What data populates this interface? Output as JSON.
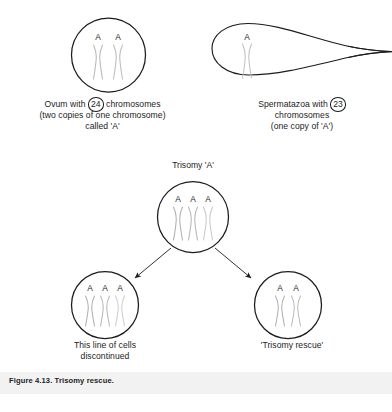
{
  "figure": {
    "caption": "Figure 4.13. Trisomy rescue.",
    "caption_band_color": "#f2f2f2",
    "background_color": "#ffffff",
    "stroke_color": "#1c1c1c",
    "chromosome_color": "#b8b8b8"
  },
  "gametes": {
    "ovum": {
      "cell_label": "ovum-circle",
      "chromosome_letters": [
        "A",
        "A"
      ],
      "chromosome_count": 2,
      "caption_lines": [
        "Ovum with ",
        " chromosomes",
        "(two copies of one chromosome)",
        "called 'A'"
      ],
      "circled_number": "24"
    },
    "sperm": {
      "cell_label": "spermatazoa-shape",
      "chromosome_letters": [
        "A"
      ],
      "chromosome_count": 1,
      "caption_lines": [
        "Spermatazoa with ",
        "chromosomes",
        "(one copy of 'A')"
      ],
      "circled_number": "23"
    }
  },
  "trisomy": {
    "top_label": "Trisomy 'A'",
    "parent": {
      "chromosome_letters": [
        "A",
        "A",
        "A"
      ],
      "chromosome_count": 3
    },
    "children": [
      {
        "position": "left",
        "chromosome_letters": [
          "A",
          "A",
          "A"
        ],
        "chromosome_count": 3,
        "caption_lines": [
          "This line of cells",
          "discontinued"
        ]
      },
      {
        "position": "right",
        "chromosome_letters": [
          "A",
          "A"
        ],
        "chromosome_count": 2,
        "caption_lines": [
          "'Trisomy rescue'"
        ]
      }
    ],
    "arrows": 2
  }
}
